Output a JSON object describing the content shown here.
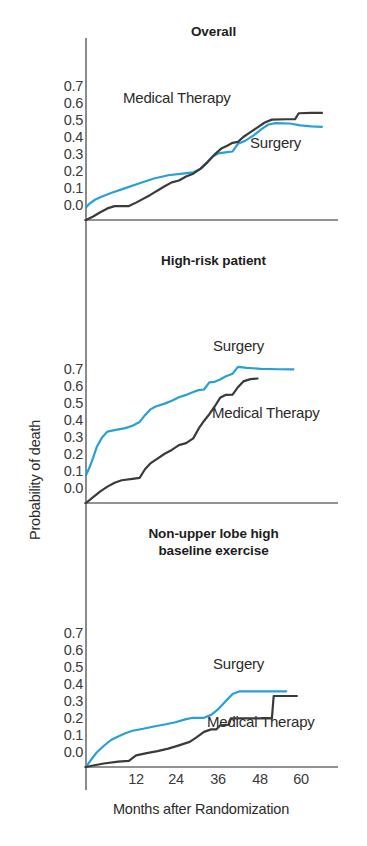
{
  "figure": {
    "background": "#ffffff",
    "axis_color": "#6e6e6e",
    "y_axis_title": "Probability of death",
    "x_axis_title": "Months after Randomization"
  },
  "colors": {
    "surgery": "#27a0d8",
    "medical_therapy": "#3a3a3a",
    "axis": "#6e6e6e",
    "text": "#2b2b2b"
  },
  "chart_data": [
    {
      "type": "line",
      "title": "Overall",
      "xlabel": "Months after Randomization",
      "ylabel": "Probability of death",
      "xlim": [
        0,
        70
      ],
      "ylim": [
        0.0,
        0.75
      ],
      "xticks": [
        12,
        24,
        36,
        48,
        60
      ],
      "yticks": [
        "0.0",
        "0.1",
        "0.2",
        "0.3",
        "0.4",
        "0.5",
        "0.6",
        "0.7"
      ],
      "grid": false,
      "legend": "inline-annotations",
      "series": [
        {
          "name": "Surgery",
          "color": "#27a0d8",
          "points": [
            [
              0.0,
              0.065
            ],
            [
              1.0,
              0.085
            ],
            [
              2.5,
              0.105
            ],
            [
              4.0,
              0.118
            ],
            [
              7.0,
              0.14
            ],
            [
              11.0,
              0.165
            ],
            [
              15.0,
              0.19
            ],
            [
              19.0,
              0.215
            ],
            [
              23.0,
              0.232
            ],
            [
              27.0,
              0.24
            ],
            [
              30.0,
              0.247
            ],
            [
              32.0,
              0.265
            ],
            [
              34.0,
              0.3
            ],
            [
              35.5,
              0.33
            ],
            [
              37.0,
              0.345
            ],
            [
              39.0,
              0.35
            ],
            [
              41.0,
              0.355
            ],
            [
              42.5,
              0.395
            ],
            [
              44.5,
              0.41
            ],
            [
              47.0,
              0.44
            ],
            [
              49.0,
              0.47
            ],
            [
              51.0,
              0.495
            ],
            [
              53.0,
              0.502
            ],
            [
              57.0,
              0.5
            ],
            [
              60.0,
              0.49
            ],
            [
              63.0,
              0.485
            ],
            [
              66.0,
              0.483
            ]
          ]
        },
        {
          "name": "Medical Therapy",
          "color": "#3a3a3a",
          "points": [
            [
              0.0,
              0.0
            ],
            [
              2.0,
              0.018
            ],
            [
              4.0,
              0.04
            ],
            [
              6.0,
              0.06
            ],
            [
              8.0,
              0.072
            ],
            [
              12.0,
              0.072
            ],
            [
              14.0,
              0.09
            ],
            [
              18.0,
              0.13
            ],
            [
              22.0,
              0.175
            ],
            [
              24.0,
              0.195
            ],
            [
              26.0,
              0.205
            ],
            [
              28.0,
              0.225
            ],
            [
              30.0,
              0.24
            ],
            [
              32.0,
              0.265
            ],
            [
              34.0,
              0.3
            ],
            [
              36.0,
              0.34
            ],
            [
              38.0,
              0.372
            ],
            [
              39.5,
              0.385
            ],
            [
              41.0,
              0.4
            ],
            [
              42.5,
              0.405
            ],
            [
              44.0,
              0.43
            ],
            [
              46.0,
              0.455
            ],
            [
              48.0,
              0.48
            ],
            [
              50.0,
              0.505
            ],
            [
              52.0,
              0.52
            ],
            [
              56.0,
              0.522
            ],
            [
              58.5,
              0.523
            ],
            [
              59.5,
              0.553
            ],
            [
              63.0,
              0.555
            ],
            [
              66.0,
              0.555
            ]
          ]
        }
      ]
    },
    {
      "type": "line",
      "title": "High-risk patient",
      "xlabel": "Months after Randomization",
      "ylabel": "Probability of death",
      "xlim": [
        0,
        70
      ],
      "ylim": [
        0.0,
        0.75
      ],
      "xticks": [
        12,
        24,
        36,
        48,
        60
      ],
      "yticks": [
        "0.0",
        "0.1",
        "0.2",
        "0.3",
        "0.4",
        "0.5",
        "0.6",
        "0.7"
      ],
      "grid": false,
      "legend": "inline-annotations",
      "series": [
        {
          "name": "Surgery",
          "color": "#27a0d8",
          "points": [
            [
              0.0,
              0.145
            ],
            [
              1.0,
              0.185
            ],
            [
              2.0,
              0.235
            ],
            [
              3.0,
              0.29
            ],
            [
              4.5,
              0.34
            ],
            [
              6.0,
              0.37
            ],
            [
              8.0,
              0.378
            ],
            [
              11.0,
              0.388
            ],
            [
              13.0,
              0.4
            ],
            [
              15.0,
              0.42
            ],
            [
              16.5,
              0.455
            ],
            [
              18.0,
              0.485
            ],
            [
              19.5,
              0.5
            ],
            [
              22.0,
              0.515
            ],
            [
              24.0,
              0.53
            ],
            [
              26.0,
              0.548
            ],
            [
              28.0,
              0.56
            ],
            [
              30.0,
              0.575
            ],
            [
              31.5,
              0.585
            ],
            [
              33.0,
              0.588
            ],
            [
              34.5,
              0.625
            ],
            [
              36.0,
              0.628
            ],
            [
              37.5,
              0.64
            ],
            [
              39.0,
              0.655
            ],
            [
              41.0,
              0.67
            ],
            [
              42.5,
              0.705
            ],
            [
              45.0,
              0.7
            ],
            [
              49.0,
              0.695
            ],
            [
              54.0,
              0.693
            ],
            [
              58.0,
              0.692
            ]
          ]
        },
        {
          "name": "Medical Therapy",
          "color": "#3a3a3a",
          "points": [
            [
              0.0,
              0.0
            ],
            [
              2.0,
              0.03
            ],
            [
              4.0,
              0.06
            ],
            [
              6.0,
              0.085
            ],
            [
              8.0,
              0.105
            ],
            [
              10.0,
              0.118
            ],
            [
              13.0,
              0.125
            ],
            [
              15.0,
              0.13
            ],
            [
              16.5,
              0.175
            ],
            [
              18.0,
              0.205
            ],
            [
              20.0,
              0.23
            ],
            [
              22.0,
              0.255
            ],
            [
              24.0,
              0.275
            ],
            [
              26.0,
              0.3
            ],
            [
              28.0,
              0.31
            ],
            [
              30.0,
              0.335
            ],
            [
              31.5,
              0.385
            ],
            [
              33.0,
              0.425
            ],
            [
              34.5,
              0.46
            ],
            [
              36.0,
              0.5
            ],
            [
              37.5,
              0.545
            ],
            [
              39.0,
              0.56
            ],
            [
              41.0,
              0.562
            ],
            [
              42.5,
              0.6
            ],
            [
              44.0,
              0.63
            ],
            [
              46.0,
              0.642
            ],
            [
              48.0,
              0.645
            ]
          ]
        }
      ]
    },
    {
      "type": "line",
      "title": "Non-upper lobe high\nbaseline exercise",
      "xlabel": "Months after Randomization",
      "ylabel": "Probability of death",
      "xlim": [
        0,
        70
      ],
      "ylim": [
        0.0,
        0.75
      ],
      "xticks": [
        12,
        24,
        36,
        48,
        60
      ],
      "yticks": [
        "0.0",
        "0.1",
        "0.2",
        "0.3",
        "0.4",
        "0.5",
        "0.6",
        "0.7"
      ],
      "grid": false,
      "legend": "inline-annotations",
      "series": [
        {
          "name": "Surgery",
          "color": "#27a0d8",
          "points": [
            [
              0.0,
              0.0
            ],
            [
              1.5,
              0.04
            ],
            [
              3.0,
              0.075
            ],
            [
              5.0,
              0.11
            ],
            [
              7.0,
              0.14
            ],
            [
              9.0,
              0.158
            ],
            [
              11.0,
              0.175
            ],
            [
              13.0,
              0.188
            ],
            [
              16.0,
              0.198
            ],
            [
              19.0,
              0.21
            ],
            [
              22.0,
              0.22
            ],
            [
              25.0,
              0.232
            ],
            [
              28.0,
              0.248
            ],
            [
              30.0,
              0.255
            ],
            [
              33.0,
              0.255
            ],
            [
              35.0,
              0.27
            ],
            [
              37.0,
              0.3
            ],
            [
              39.0,
              0.34
            ],
            [
              41.0,
              0.378
            ],
            [
              43.0,
              0.392
            ],
            [
              47.0,
              0.392
            ],
            [
              52.0,
              0.392
            ],
            [
              56.0,
              0.392
            ]
          ]
        },
        {
          "name": "Medical Therapy",
          "color": "#3a3a3a",
          "points": [
            [
              0.0,
              0.0
            ],
            [
              2.0,
              0.008
            ],
            [
              5.0,
              0.018
            ],
            [
              9.0,
              0.028
            ],
            [
              12.0,
              0.032
            ],
            [
              14.0,
              0.06
            ],
            [
              17.0,
              0.072
            ],
            [
              20.0,
              0.082
            ],
            [
              23.0,
              0.095
            ],
            [
              26.0,
              0.112
            ],
            [
              29.0,
              0.13
            ],
            [
              31.0,
              0.155
            ],
            [
              33.0,
              0.182
            ],
            [
              35.0,
              0.195
            ],
            [
              36.5,
              0.195
            ],
            [
              37.5,
              0.215
            ],
            [
              39.0,
              0.218
            ],
            [
              40.0,
              0.22
            ],
            [
              40.5,
              0.252
            ],
            [
              47.0,
              0.252
            ],
            [
              52.0,
              0.252
            ],
            [
              52.5,
              0.368
            ],
            [
              56.0,
              0.368
            ],
            [
              59.0,
              0.368
            ]
          ]
        }
      ]
    }
  ],
  "panels": [
    {
      "id": "overall",
      "title": "Overall",
      "y_ticks": [
        "0.7",
        "0.6",
        "0.5",
        "0.4",
        "0.3",
        "0.2",
        "0.1",
        "0.0"
      ],
      "annotations": [
        {
          "name": "medical-therapy-label",
          "text": "Medical Therapy"
        },
        {
          "name": "surgery-label",
          "text": "Surgery"
        }
      ]
    },
    {
      "id": "high-risk-patient",
      "title": "High-risk patient",
      "y_ticks": [
        "0.7",
        "0.6",
        "0.5",
        "0.4",
        "0.3",
        "0.2",
        "0.1",
        "0.0"
      ],
      "annotations": [
        {
          "name": "surgery-label",
          "text": "Surgery"
        },
        {
          "name": "medical-therapy-label",
          "text": "Medical Therapy"
        }
      ]
    },
    {
      "id": "non-upper-lobe",
      "title_line1": "Non-upper lobe high",
      "title_line2": "baseline exercise",
      "y_ticks": [
        "0.7",
        "0.6",
        "0.5",
        "0.4",
        "0.3",
        "0.2",
        "0.1",
        "0.0"
      ],
      "annotations": [
        {
          "name": "surgery-label",
          "text": "Surgery"
        },
        {
          "name": "medical-therapy-label",
          "text": "Medical Therapy"
        }
      ]
    }
  ],
  "x_tick_labels": [
    "12",
    "24",
    "36",
    "48",
    "60"
  ]
}
